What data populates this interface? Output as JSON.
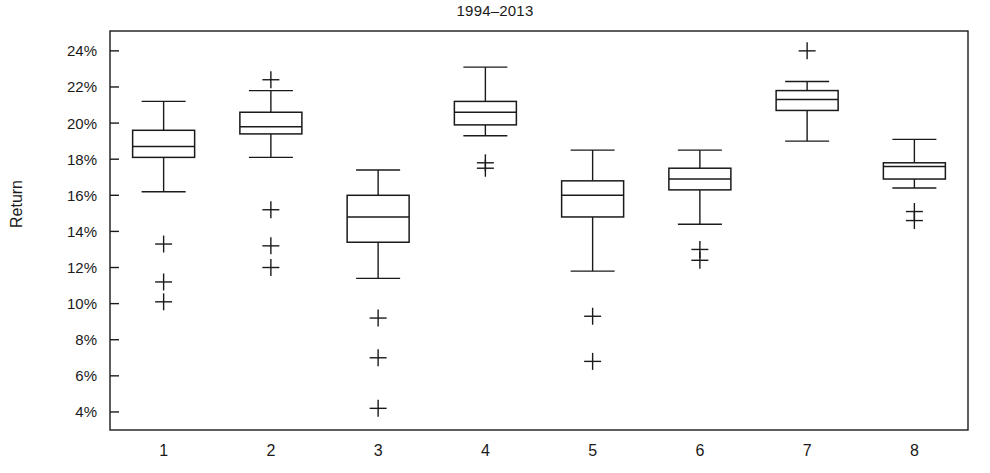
{
  "chart_data": {
    "type": "box",
    "title": "1994–2013",
    "xlabel": "",
    "ylabel": "Return",
    "categories": [
      "1",
      "2",
      "3",
      "4",
      "5",
      "6",
      "7",
      "8"
    ],
    "ylim": [
      3.0,
      25.1
    ],
    "ytick_values": [
      4,
      6,
      8,
      10,
      12,
      14,
      16,
      18,
      20,
      22,
      24
    ],
    "ytick_labels": [
      "4%",
      "6%",
      "8%",
      "10%",
      "12%",
      "14%",
      "16%",
      "18%",
      "20%",
      "22%",
      "24%"
    ],
    "grid": false,
    "legend": null,
    "units": "percent",
    "boxes": [
      {
        "category": "1",
        "whisker_low": 16.2,
        "q1": 18.1,
        "median": 18.7,
        "q3": 19.6,
        "whisker_high": 21.2,
        "outliers": [
          13.3,
          11.2,
          10.1
        ]
      },
      {
        "category": "2",
        "whisker_low": 18.1,
        "q1": 19.4,
        "median": 19.8,
        "q3": 20.6,
        "whisker_high": 21.8,
        "outliers": [
          22.4,
          15.2,
          13.2,
          12.0
        ]
      },
      {
        "category": "3",
        "whisker_low": 11.4,
        "q1": 13.4,
        "median": 14.8,
        "q3": 16.0,
        "whisker_high": 17.4,
        "outliers": [
          9.2,
          7.0,
          4.2
        ]
      },
      {
        "category": "4",
        "whisker_low": 19.3,
        "q1": 19.9,
        "median": 20.6,
        "q3": 21.2,
        "whisker_high": 23.1,
        "outliers": [
          17.8,
          17.5
        ]
      },
      {
        "category": "5",
        "whisker_low": 11.8,
        "q1": 14.8,
        "median": 16.0,
        "q3": 16.8,
        "whisker_high": 18.5,
        "outliers": [
          9.3,
          6.8
        ]
      },
      {
        "category": "6",
        "whisker_low": 14.4,
        "q1": 16.3,
        "median": 16.9,
        "q3": 17.5,
        "whisker_high": 18.5,
        "outliers": [
          13.0,
          12.4
        ]
      },
      {
        "category": "7",
        "whisker_low": 19.0,
        "q1": 20.7,
        "median": 21.3,
        "q3": 21.8,
        "whisker_high": 22.3,
        "outliers": [
          24.0
        ]
      },
      {
        "category": "8",
        "whisker_low": 16.4,
        "q1": 16.9,
        "median": 17.6,
        "q3": 17.8,
        "whisker_high": 19.1,
        "outliers": [
          15.1,
          14.6
        ]
      }
    ]
  },
  "colors": {
    "ink": "#1a1a1a",
    "background": "#ffffff",
    "box_fill": "#ffffff"
  }
}
